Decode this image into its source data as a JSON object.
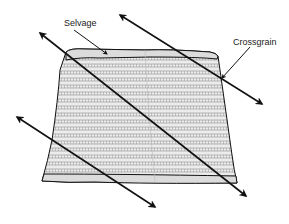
{
  "diagram": {
    "labels": {
      "selvage": "Selvage",
      "crossgrain": "Crossgrain"
    },
    "colors": {
      "line": "#111111",
      "fabric_fill": "#e6e6e6",
      "stripe": "#8a8a8a",
      "background": "#ffffff"
    }
  }
}
